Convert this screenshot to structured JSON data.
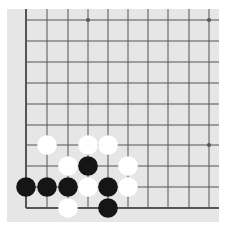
{
  "board": {
    "colors": {
      "background": "#e6e6e6",
      "line": "#555555",
      "black_stone": "#151515",
      "white_stone": "#ffffff"
    },
    "grid": {
      "x_lines": [
        26,
        47,
        68,
        88,
        108,
        128,
        148,
        168,
        189,
        209
      ],
      "y_lines": [
        20,
        41,
        62,
        83,
        104,
        125,
        145,
        166,
        187,
        208
      ],
      "left_edge_x": 26,
      "bottom_edge_y": 208,
      "top_extent": 9,
      "right_extent": 219
    },
    "star_points": [
      {
        "col": 3,
        "row": 0
      },
      {
        "col": 9,
        "row": 0
      },
      {
        "col": 9,
        "row": 6
      }
    ],
    "stones": [
      {
        "color": "white",
        "col": 1,
        "row": 6
      },
      {
        "color": "white",
        "col": 3,
        "row": 6
      },
      {
        "color": "white",
        "col": 4,
        "row": 6
      },
      {
        "color": "white",
        "col": 2,
        "row": 7
      },
      {
        "color": "black",
        "col": 3,
        "row": 7
      },
      {
        "color": "white",
        "col": 5,
        "row": 7
      },
      {
        "color": "black",
        "col": 0,
        "row": 8
      },
      {
        "color": "black",
        "col": 1,
        "row": 8
      },
      {
        "color": "black",
        "col": 2,
        "row": 8
      },
      {
        "color": "white",
        "col": 3,
        "row": 8
      },
      {
        "color": "black",
        "col": 4,
        "row": 8
      },
      {
        "color": "white",
        "col": 5,
        "row": 8
      },
      {
        "color": "white",
        "col": 2,
        "row": 9
      },
      {
        "color": "black",
        "col": 4,
        "row": 9
      }
    ]
  }
}
